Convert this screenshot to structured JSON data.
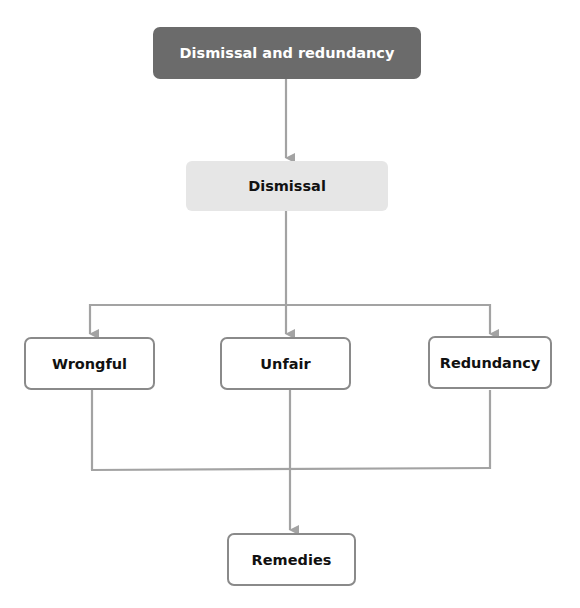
{
  "diagram": {
    "type": "hierarchy",
    "colors": {
      "root_fill": "#6b6b6b",
      "root_text": "#ffffff",
      "level1_fill": "#e6e6e6",
      "child_border": "#8a8a8a",
      "connector": "#a3a3a3",
      "text": "#111111"
    },
    "nodes": {
      "root": "Dismissal and redundancy",
      "dismissal": "Dismissal",
      "wrongful": "Wrongful",
      "unfair": "Unfair",
      "redundancy": "Redundancy",
      "remedies": "Remedies"
    },
    "edges": [
      [
        "Dismissal and redundancy",
        "Dismissal"
      ],
      [
        "Dismissal",
        "Wrongful"
      ],
      [
        "Dismissal",
        "Unfair"
      ],
      [
        "Dismissal",
        "Redundancy"
      ],
      [
        "Wrongful",
        "Remedies"
      ],
      [
        "Unfair",
        "Remedies"
      ],
      [
        "Redundancy",
        "Remedies"
      ]
    ]
  }
}
